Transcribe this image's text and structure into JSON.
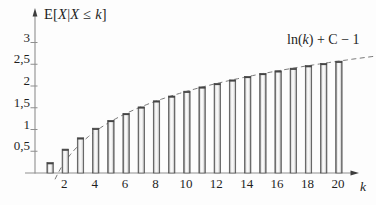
{
  "labels": {
    "title_parts": [
      "E[",
      "X",
      "|",
      "X",
      " ≤ ",
      "k",
      "]"
    ],
    "curve_label_parts": [
      "ln(",
      "k",
      ") + C − 1"
    ],
    "x_axis_label": "k"
  },
  "colors": {
    "background": "#fdfdfd",
    "axis": "#8f8f8f",
    "arrow": "#3d3d3d",
    "text": "#1f1f1f",
    "dash": "#7a7a7a",
    "bar_edge": "#4f4f4f",
    "bar_cap": "#454545",
    "bar_fill_light": "#fbfbfb",
    "bar_fill_shade": "#d8d8d8"
  },
  "chart_data": {
    "type": "bar",
    "title": "E[X|X ≤ k]",
    "xlabel": "k",
    "ylabel": "",
    "grid": false,
    "legend": "none",
    "xlim": [
      0,
      22.5
    ],
    "ylim": [
      0,
      3.3
    ],
    "x": [
      1,
      2,
      3,
      4,
      5,
      6,
      7,
      8,
      9,
      10,
      11,
      12,
      13,
      14,
      15,
      16,
      17,
      18,
      19,
      20
    ],
    "values": [
      0.24,
      0.55,
      0.81,
      1.03,
      1.21,
      1.37,
      1.52,
      1.66,
      1.77,
      1.88,
      1.98,
      2.06,
      2.14,
      2.22,
      2.29,
      2.35,
      2.41,
      2.47,
      2.52,
      2.57
    ],
    "y_ticks": [
      {
        "v": 0.5,
        "label": "0,5"
      },
      {
        "v": 1,
        "label": "1"
      },
      {
        "v": 1.5,
        "label": "1,5"
      },
      {
        "v": 2,
        "label": "2"
      },
      {
        "v": 2.5,
        "label": "2,5"
      },
      {
        "v": 3,
        "label": "3"
      }
    ],
    "x_ticks": [
      {
        "v": 2,
        "label": "2"
      },
      {
        "v": 4,
        "label": "4"
      },
      {
        "v": 6,
        "label": "6"
      },
      {
        "v": 8,
        "label": "8"
      },
      {
        "v": 10,
        "label": "10"
      },
      {
        "v": 12,
        "label": "12"
      },
      {
        "v": 14,
        "label": "14"
      },
      {
        "v": 16,
        "label": "16"
      },
      {
        "v": 18,
        "label": "18"
      },
      {
        "v": 20,
        "label": "20"
      }
    ],
    "asymptote": {
      "label": "ln(k) + C − 1",
      "formula": "ln(k) + C - 1",
      "C": 0.5772,
      "k_start": 1.32,
      "k_end": 22.4,
      "dash_px": 5,
      "gap_px": 3.5
    }
  }
}
